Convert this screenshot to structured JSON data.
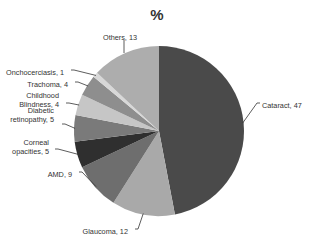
{
  "chart_data": {
    "type": "pie",
    "title": "%",
    "categories": [
      "Cataract",
      "Glaucoma",
      "AMD",
      "Corneal opacities",
      "Diabetic retinopathy",
      "Childhood Blindness",
      "Trachoma",
      "Onchocerciasis",
      "Others"
    ],
    "values": [
      47,
      12,
      9,
      5,
      5,
      4,
      4,
      1,
      13
    ],
    "labels": [
      "Cataract, 47",
      "Glaucoma, 12",
      "AMD, 9",
      "Corneal opacities, 5",
      "Diabetic retinopathy, 5",
      "Childhood Blindness, 4",
      "Trachoma, 4",
      "Onchocerciasis, 1",
      "Others, 13"
    ],
    "colors": [
      "#4a4a4a",
      "#a9a9a9",
      "#6e6e6e",
      "#2f2f2f",
      "#7a7a7a",
      "#c6c6c6",
      "#8e8e8e",
      "#d8d8d8",
      "#adadad"
    ],
    "start_angle": "12 o'clock",
    "direction": "clockwise",
    "legend": "none (data labels with leader lines)"
  }
}
